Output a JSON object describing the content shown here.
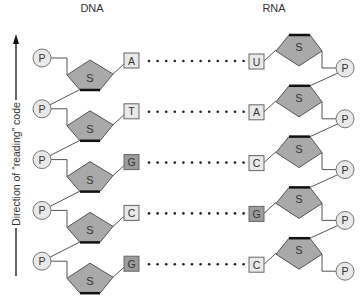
{
  "headers": {
    "dna": "DNA",
    "rna": "RNA"
  },
  "axis": {
    "label": "Direction of “reading” code",
    "direction": "up"
  },
  "colors": {
    "sugar_fill": "#a9a9a9",
    "sugar_stroke": "#555555",
    "sugar_edge": "#111111",
    "phosphate_fill": "#e8e8e8",
    "base_light": "#e9e9e9",
    "base_dark": "#9c9c9c",
    "line": "#555555",
    "dots": "#222222"
  },
  "labels": {
    "sugar": "S",
    "phosphate": "P"
  },
  "pairs": [
    {
      "dna_base": "A",
      "rna_base": "U",
      "dna_base_shade": "light",
      "rna_base_shade": "light"
    },
    {
      "dna_base": "T",
      "rna_base": "A",
      "dna_base_shade": "light",
      "rna_base_shade": "light"
    },
    {
      "dna_base": "G",
      "rna_base": "C",
      "dna_base_shade": "dark",
      "rna_base_shade": "light"
    },
    {
      "dna_base": "C",
      "rna_base": "G",
      "dna_base_shade": "light",
      "rna_base_shade": "dark"
    },
    {
      "dna_base": "G",
      "rna_base": "C",
      "dna_base_shade": "dark",
      "rna_base_shade": "light"
    }
  ]
}
